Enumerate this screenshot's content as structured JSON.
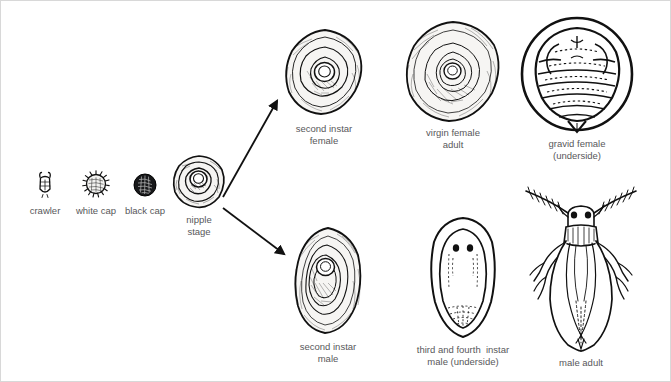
{
  "diagram": {
    "background_color": "#ffffff",
    "ink_color": "#1a1a1a",
    "caption_color": "#58585a"
  },
  "stages": {
    "crawler": {
      "label": "crawler",
      "icon": "crawler-nymph-icon"
    },
    "white_cap": {
      "label": "white cap",
      "icon": "white-cap-scale-icon"
    },
    "black_cap": {
      "label": "black cap",
      "icon": "black-cap-scale-icon"
    },
    "nipple_stage": {
      "label": "nipple\nstage",
      "icon": "nipple-stage-scale-icon"
    },
    "second_instar_female": {
      "label": "second instar\nfemale",
      "icon": "second-instar-female-scale-icon"
    },
    "virgin_female_adult": {
      "label": "virgin female\nadult",
      "icon": "virgin-female-adult-scale-icon"
    },
    "gravid_female": {
      "label": "gravid female\n(underside)",
      "icon": "gravid-female-underside-icon"
    },
    "second_instar_male": {
      "label": "second instar\nmale",
      "icon": "second-instar-male-scale-icon"
    },
    "third_fourth_instar_male": {
      "label": "third and fourth  instar\nmale (underside)",
      "icon": "third-fourth-instar-male-underside-icon"
    },
    "male_adult": {
      "label": "male adult",
      "icon": "male-adult-winged-insect-icon"
    }
  },
  "arrows": {
    "to_female_branch": "arrow-nipple-to-female",
    "to_male_branch": "arrow-nipple-to-male"
  }
}
